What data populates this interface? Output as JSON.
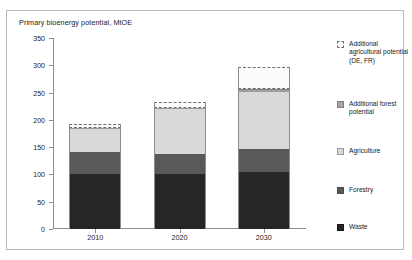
{
  "chart_data": {
    "type": "bar",
    "subtype": "stacked",
    "title": "Primary bioenergy potential, MtOE",
    "xlabel": "",
    "ylabel": "",
    "categories": [
      "2010",
      "2020",
      "2030"
    ],
    "ylim": [
      0,
      350
    ],
    "yticks": [
      0,
      50,
      100,
      150,
      200,
      250,
      300,
      350
    ],
    "grid": false,
    "legend_position": "right",
    "series": [
      {
        "name": "Waste",
        "values": [
          100,
          100,
          105
        ],
        "color": "#262626"
      },
      {
        "name": "Forestry",
        "values": [
          42,
          37,
          42
        ],
        "color": "#595959"
      },
      {
        "name": "Agriculture",
        "values": [
          43,
          85,
          105
        ],
        "color": "#d9d9d9"
      },
      {
        "name": "Additional forest potential",
        "values": [
          0,
          0,
          5
        ],
        "color": "#a6a6a6"
      },
      {
        "name": "Additional agricultural potential (DE, FR)",
        "values": [
          8,
          10,
          40
        ],
        "color": "#fbfbfb"
      }
    ],
    "totals": [
      193,
      232,
      297
    ]
  },
  "legend": {
    "items": [
      {
        "label": "Additional agricultural potential (DE, FR)"
      },
      {
        "label": "Additional forest potential"
      },
      {
        "label": "Agriculture"
      },
      {
        "label": "Forestry"
      },
      {
        "label": "Waste"
      }
    ]
  }
}
